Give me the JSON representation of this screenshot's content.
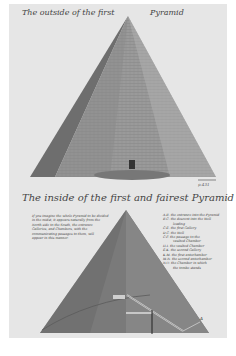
{
  "plate": {
    "top_title_left": "The outside of the first",
    "top_title_right": "Pyramid",
    "bottom_title": "The inside of the first and fairest Pyramid",
    "page_number": "p.431",
    "left_legend": [
      "If you imagine the whole Pyramid to be divided",
      "in the midst, it appears naturally from the",
      "North side to the South, the entrance",
      "Galleries, and Chambers, with the",
      "communicating passages to them, will",
      "appear in this manner."
    ],
    "right_legend": [
      "A.B. the entrance into the Pyramid",
      "B.C. the descent into the Well",
      "leading",
      "C.E. the first Gallery",
      "D.C. the Well",
      "C.F. the passage to the",
      "vaulted Chamber",
      "H.I. the vaulted Chamber",
      "E.K. the second Gallery",
      "K.M. the first antechamber",
      "M.N. the second antechamber",
      "N.O. the Chamber in which",
      "the tombe stands"
    ],
    "label_A": "A"
  },
  "colors": {
    "paper": "#e6e6e6",
    "pyramid_dark": "#6f6f6f",
    "pyramid_mid": "#8f8f8f",
    "pyramid_light": "#a9a9a9"
  }
}
